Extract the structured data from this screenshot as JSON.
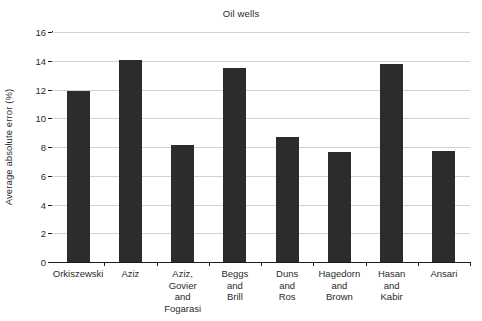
{
  "chart_data": {
    "type": "bar",
    "title": "Oil wells",
    "xlabel": "",
    "ylabel": "Average absolute error (%)",
    "categories": [
      "Orkiszewski",
      "Aziz",
      "Aziz,\nGovier\nand\nFogarasi",
      "Beggs\nand\nBrill",
      "Duns\nand\nRos",
      "Hagedorn\nand\nBrown",
      "Hasan\nand\nKabir",
      "Ansari"
    ],
    "values": [
      11.9,
      14.05,
      8.15,
      13.5,
      8.7,
      7.65,
      13.75,
      7.7
    ],
    "ylim": [
      0,
      16
    ],
    "ytick_labels": [
      "0",
      "2",
      "4",
      "6",
      "8",
      "10",
      "12",
      "14",
      "16"
    ],
    "ytick_values": [
      0,
      2,
      4,
      6,
      8,
      10,
      12,
      14,
      16
    ],
    "grid": true,
    "legend": "none",
    "bar_color": "#2c2c2c",
    "grid_color": "#d2d2d2",
    "axis_color": "#1c1c1c"
  }
}
